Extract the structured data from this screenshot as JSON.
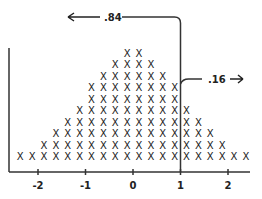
{
  "chart_data": {
    "type": "scatter",
    "subtype": "dot-plot",
    "title": "",
    "xlabel": "",
    "ylabel": "",
    "marker": "X",
    "xlim": [
      -2.5,
      2.5
    ],
    "ylim": [
      0,
      10
    ],
    "bin_width": 0.25,
    "bin_centers": [
      -2.375,
      -2.125,
      -1.875,
      -1.625,
      -1.375,
      -1.125,
      -0.875,
      -0.625,
      -0.375,
      -0.125,
      0.125,
      0.375,
      0.625,
      0.875,
      1.125,
      1.375,
      1.625,
      1.875,
      2.125,
      2.375
    ],
    "counts": [
      1,
      1,
      2,
      3,
      4,
      5,
      7,
      8,
      9,
      10,
      10,
      9,
      8,
      7,
      5,
      4,
      3,
      2,
      1,
      1
    ],
    "total": 100,
    "x_ticks": [
      -2,
      -1,
      0,
      1,
      2
    ],
    "x_tick_labels": [
      "-2",
      "-1",
      "0",
      "1",
      "2"
    ],
    "cutoff": 1,
    "annotations": [
      {
        "label": ".84",
        "direction": "left",
        "meaning": "proportion below cutoff"
      },
      {
        "label": ".16",
        "direction": "right",
        "meaning": "proportion above cutoff"
      }
    ],
    "grid": false,
    "legend": "none"
  }
}
